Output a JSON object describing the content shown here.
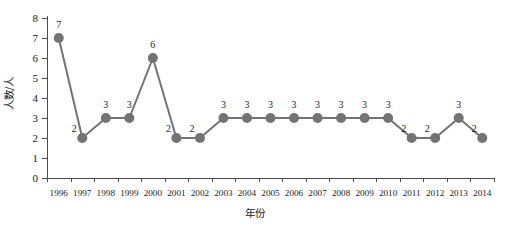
{
  "chart_data": {
    "type": "line",
    "title": "",
    "subtitle": "",
    "xlabel": "年份",
    "ylabel": "人数/人",
    "categories": [
      "1996",
      "1997",
      "1998",
      "1999",
      "2000",
      "2001",
      "2002",
      "2003",
      "2004",
      "2005",
      "2006",
      "2007",
      "2008",
      "2009",
      "2010",
      "2011",
      "2012",
      "2013",
      "2014"
    ],
    "values": [
      7,
      2,
      3,
      3,
      6,
      2,
      2,
      3,
      3,
      3,
      3,
      3,
      3,
      3,
      3,
      2,
      2,
      3,
      2
    ],
    "data_labels": [
      "7",
      "2",
      "3",
      "3",
      "6",
      "2",
      "2",
      "3",
      "3",
      "3",
      "3",
      "3",
      "3",
      "3",
      "3",
      "2",
      "2",
      "3",
      "2"
    ],
    "label_positions": [
      "above",
      "below",
      "above",
      "above",
      "above",
      "below",
      "below",
      "above",
      "above",
      "above",
      "above",
      "above",
      "above",
      "above",
      "above",
      "below",
      "below",
      "above",
      "below"
    ],
    "ylim": [
      0,
      8
    ],
    "y_ticks": [
      "0",
      "1",
      "2",
      "3",
      "4",
      "5",
      "6",
      "7",
      "8"
    ],
    "x_tick_labels": [
      "1996",
      "1997",
      "1998",
      "1999",
      "2000",
      "2001",
      "2002",
      "2003",
      "2004",
      "2005",
      "2006",
      "2007",
      "2008",
      "2009",
      "2010",
      "2011",
      "2012",
      "2013",
      "2014"
    ],
    "grid": false,
    "legend": false,
    "legend_position": "none",
    "series_color": "#737373",
    "marker": "circle",
    "marker_size": 5,
    "line_width": 2,
    "axis_color": "#4d4d4d",
    "background": "#ffffff"
  }
}
